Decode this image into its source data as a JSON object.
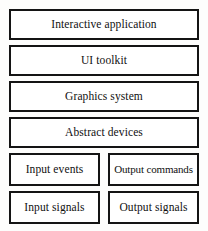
{
  "diagram": {
    "type": "layer-stack",
    "colors": {
      "border": "#141414",
      "box_fill": "#ffffff",
      "background": "#fdfdfc",
      "text": "#101010"
    },
    "layers": [
      {
        "label": "Interactive application",
        "span": "full"
      },
      {
        "label": "UI toolkit",
        "span": "full"
      },
      {
        "label": "Graphics system",
        "span": "full"
      },
      {
        "label": "Abstract devices",
        "span": "full"
      }
    ],
    "split_rows": [
      {
        "left": {
          "label": "Input events"
        },
        "right": {
          "label": "Output commands"
        }
      },
      {
        "left": {
          "label": "Input signals"
        },
        "right": {
          "label": "Output signals"
        }
      }
    ]
  }
}
